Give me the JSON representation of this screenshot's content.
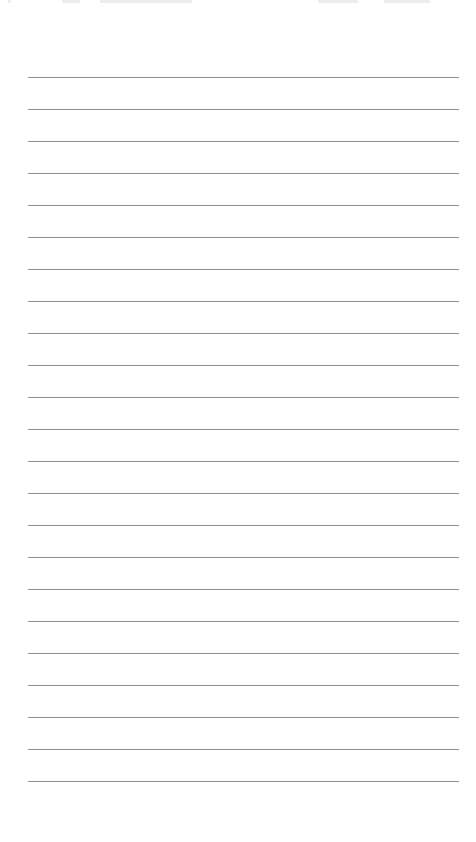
{
  "page": {
    "type": "lined-paper",
    "background_color": "#ffffff",
    "line_color": "#8f8f8f",
    "line_count": 23,
    "first_line_y": 77,
    "line_spacing": 32,
    "line_left": 28,
    "line_right": 459
  },
  "header": {
    "clipped_text_fragments": [
      {
        "x": 8,
        "width": 3
      },
      {
        "x": 62,
        "width": 18
      },
      {
        "x": 100,
        "width": 92
      },
      {
        "x": 318,
        "width": 40
      },
      {
        "x": 384,
        "width": 46
      }
    ]
  }
}
